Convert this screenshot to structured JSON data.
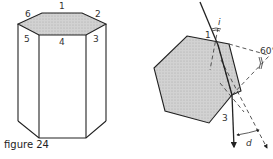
{
  "caption": "figure 24",
  "prism": {
    "vertex_labels": [
      "1",
      "2",
      "3",
      "4",
      "5",
      "6"
    ]
  },
  "refraction": {
    "face_labels": {
      "entry": "1",
      "exit": "3"
    },
    "angle_labels": {
      "incidence": "i",
      "apex": "60°",
      "deviation": "d"
    }
  },
  "colors": {
    "stroke": "#222222",
    "fill": "#c8c8c8",
    "dash": "#444444"
  }
}
